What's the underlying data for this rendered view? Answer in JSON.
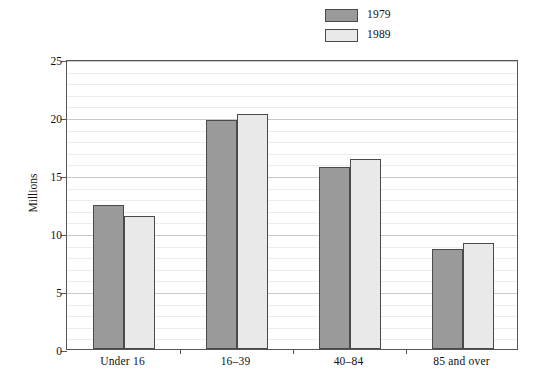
{
  "chart_data": {
    "type": "bar",
    "title": "",
    "subtitle": "",
    "xlabel": "",
    "ylabel": "Millions",
    "categories": [
      "Under 16",
      "16–39",
      "40–84",
      "85 and over"
    ],
    "series": [
      {
        "name": "1979",
        "color": "#9a9a9a",
        "values": [
          12.4,
          19.7,
          15.7,
          8.6
        ]
      },
      {
        "name": "1989",
        "color": "#e9e9e9",
        "values": [
          11.5,
          20.3,
          16.4,
          9.1
        ]
      }
    ],
    "ylim": [
      0,
      25
    ],
    "yticks": [
      0,
      5,
      10,
      15,
      20,
      25
    ],
    "ytick_labels": [
      "0",
      "5",
      "10",
      "15",
      "20",
      "25"
    ],
    "minor_tick_step": 1,
    "grid": true,
    "grid_axis": "y",
    "legend": {
      "position": "top-center",
      "entries": [
        {
          "label": "1979",
          "swatch_color": "#9a9a9a"
        },
        {
          "label": "1989",
          "swatch_color": "#e9e9e9"
        }
      ]
    },
    "colors": {
      "background": "#ffffff",
      "frame": "#555555",
      "gridline_major": "#c9c9c9",
      "gridline_minor": "#ededed",
      "bar_outline": "#4a4a4a",
      "text": "#111111"
    }
  }
}
